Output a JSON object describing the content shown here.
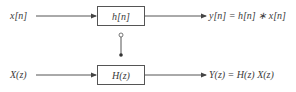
{
  "time_domain": {
    "input_label": "x[n]",
    "system_label": "h[n]",
    "output_label": "y[n] = h[n] ∗ x[n]"
  },
  "z_domain": {
    "input_label": "X(z)",
    "system_label": "H(z)",
    "output_label": "Y(z) = H(z) X(z)"
  },
  "colors": {
    "line": "#555555",
    "text": "#3a3a3a"
  }
}
